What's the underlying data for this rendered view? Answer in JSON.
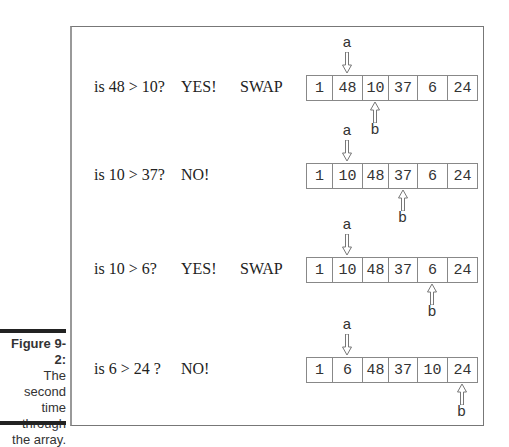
{
  "figure": {
    "label": "Figure 9-2:",
    "caption_lines": [
      "The second",
      "time",
      "through",
      "the array."
    ]
  },
  "steps": [
    {
      "question": "is 48 > 10?",
      "answer": "YES!",
      "action": "SWAP",
      "array": [
        "1",
        "48",
        "10",
        "37",
        "6",
        "24"
      ],
      "a_index": 1,
      "b_index": 2
    },
    {
      "question": "is 10 > 37?",
      "answer": "NO!",
      "action": "",
      "array": [
        "1",
        "10",
        "48",
        "37",
        "6",
        "24"
      ],
      "a_index": 1,
      "b_index": 3
    },
    {
      "question": "is 10 > 6?",
      "answer": "YES!",
      "action": "SWAP",
      "array": [
        "1",
        "10",
        "48",
        "37",
        "6",
        "24"
      ],
      "a_index": 1,
      "b_index": 4
    },
    {
      "question": "is 6 > 24 ?",
      "answer": "NO!",
      "action": "",
      "array": [
        "1",
        "6",
        "48",
        "37",
        "10",
        "24"
      ],
      "a_index": 1,
      "b_index": 5
    }
  ],
  "pointers": {
    "a": "a",
    "b": "b"
  }
}
